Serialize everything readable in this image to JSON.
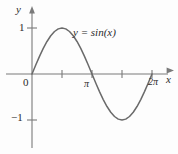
{
  "chart_data": {
    "type": "line",
    "title": "",
    "equation_label": "y = sin(x)",
    "xlabel": "x",
    "ylabel": "y",
    "xlim": [
      0,
      6.283185307179586
    ],
    "ylim": [
      -1.35,
      1.35
    ],
    "grid": false,
    "legend_position": "none",
    "x_tick_labels": [
      "0",
      "",
      "π",
      "",
      "2π"
    ],
    "x_tick_values": [
      0,
      1.5707963,
      3.1415927,
      4.712389,
      6.2831853
    ],
    "y_tick_labels": [
      "1",
      "−1"
    ],
    "y_tick_values": [
      1,
      -1
    ],
    "series": [
      {
        "name": "y = sin(x)",
        "color": "#6a6a6a",
        "x": [
          0.0,
          0.1963,
          0.3927,
          0.589,
          0.7854,
          0.9817,
          1.1781,
          1.3744,
          1.5708,
          1.7671,
          1.9635,
          2.1598,
          2.3562,
          2.5525,
          2.7489,
          2.9452,
          3.1416,
          3.3379,
          3.5343,
          3.7306,
          3.927,
          4.1233,
          4.3197,
          4.516,
          4.7124,
          4.9087,
          5.1051,
          5.3014,
          5.4978,
          5.6941,
          5.8905,
          6.0868,
          6.2832
        ],
        "y": [
          0.0,
          0.1951,
          0.3827,
          0.5556,
          0.7071,
          0.8315,
          0.9239,
          0.9808,
          1.0,
          0.9808,
          0.9239,
          0.8315,
          0.7071,
          0.5556,
          0.3827,
          0.1951,
          0.0,
          -0.1951,
          -0.3827,
          -0.5556,
          -0.7071,
          -0.8315,
          -0.9239,
          -0.9808,
          -1.0,
          -0.9808,
          -0.9239,
          -0.8315,
          -0.7071,
          -0.5556,
          -0.3827,
          -0.1951,
          0.0
        ]
      }
    ],
    "annotations": [
      {
        "text": "y = sin(x)",
        "x": 2.1,
        "y": 0.75
      }
    ]
  },
  "axes": {
    "y_axis_label": "y",
    "x_axis_label": "x",
    "origin_label": "0",
    "tick_one": "1",
    "tick_negative_one": "−1",
    "tick_pi": "π",
    "tick_two_pi": "2π"
  },
  "colors": {
    "curve": "#6a6a6a",
    "axis": "#707070",
    "text": "#2b2b2b",
    "background": "#fdfdfd"
  }
}
